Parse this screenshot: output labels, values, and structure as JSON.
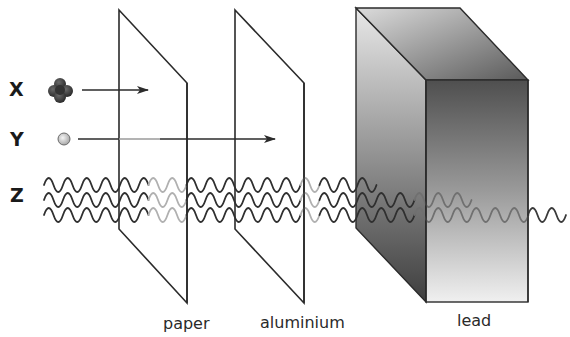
{
  "diagram": {
    "radiation": [
      {
        "id": "X",
        "label": "X",
        "symbol": "particle-cluster",
        "stopped_by": "paper"
      },
      {
        "id": "Y",
        "label": "Y",
        "symbol": "small-particle",
        "stopped_by": "aluminium"
      },
      {
        "id": "Z",
        "label": "Z",
        "symbol": "wave",
        "stopped_by": "lead (partially passes through)"
      }
    ],
    "materials": [
      {
        "id": "paper",
        "label": "paper",
        "shape": "thin-sheet"
      },
      {
        "id": "aluminium",
        "label": "aluminium",
        "shape": "thin-sheet"
      },
      {
        "id": "lead",
        "label": "lead",
        "shape": "thick-block"
      }
    ],
    "colors": {
      "line": "#2b2b2b",
      "faded_wave": "#a8a8a8",
      "inside_lead_wave": "#6a6a6a",
      "lead_dark": "#4a4a4a",
      "lead_light": "#e6e6e6",
      "particle_x": "#3a3a3a",
      "particle_y": "#cfcfcf"
    }
  }
}
